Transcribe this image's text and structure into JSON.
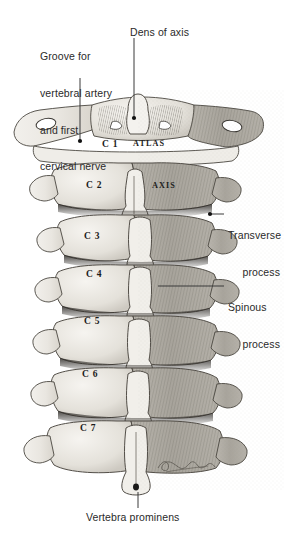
{
  "figure": {
    "background_color": "#ffffff",
    "ink_color": "#2a2a2a",
    "width": 284,
    "height": 533
  },
  "callouts": {
    "groove": {
      "line1": "Groove for",
      "line2": "vertebral artery",
      "line3": "and first",
      "line4": "cervical nerve"
    },
    "dens": {
      "text": "Dens of axis"
    },
    "transverse": {
      "line1": "Transverse",
      "line2": "process"
    },
    "spinous": {
      "line1": "Spinous",
      "line2": "process"
    },
    "prominens": {
      "text": "Vertebra prominens"
    }
  },
  "vertebrae": [
    {
      "id": "c1",
      "label": "C 1",
      "name": "ATLAS"
    },
    {
      "id": "c2",
      "label": "C 2",
      "name": "AXIS"
    },
    {
      "id": "c3",
      "label": "C 3",
      "name": ""
    },
    {
      "id": "c4",
      "label": "C 4",
      "name": ""
    },
    {
      "id": "c5",
      "label": "C 5",
      "name": ""
    },
    {
      "id": "c6",
      "label": "C 6",
      "name": ""
    },
    {
      "id": "c7",
      "label": "C 7",
      "name": ""
    }
  ],
  "signature": {
    "present": true,
    "style": "cursive-artist-signature"
  }
}
